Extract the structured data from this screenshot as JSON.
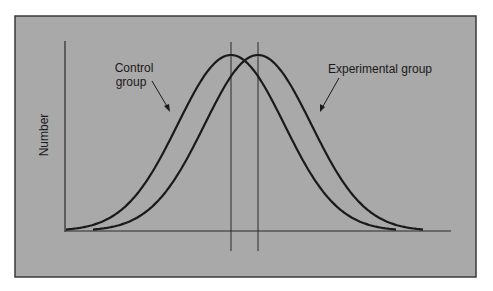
{
  "chart_data": {
    "type": "line",
    "title": "",
    "xlabel": "",
    "ylabel": "Number",
    "grid": false,
    "legend": "annotations",
    "series": [
      {
        "name": "Control group",
        "mean_marker": true,
        "shape": "normal",
        "relative_mean": 0.0,
        "peak": 1.0
      },
      {
        "name": "Experimental group",
        "mean_marker": true,
        "shape": "normal",
        "relative_mean": 0.16,
        "peak": 1.0
      }
    ],
    "annotations": [
      {
        "text": "Control group",
        "points_to": "Control group"
      },
      {
        "text": "Experimental group",
        "points_to": "Experimental group"
      }
    ],
    "vertical_lines": [
      "Control group mean",
      "Experimental group mean"
    ]
  },
  "labels": {
    "ylabel": "Number",
    "control_line1": "Control",
    "control_line2": "group",
    "experimental": "Experimental group"
  },
  "colors": {
    "panel": "#a9a9a9",
    "frame": "#3a3a3a",
    "ink": "#1a1a1a"
  }
}
